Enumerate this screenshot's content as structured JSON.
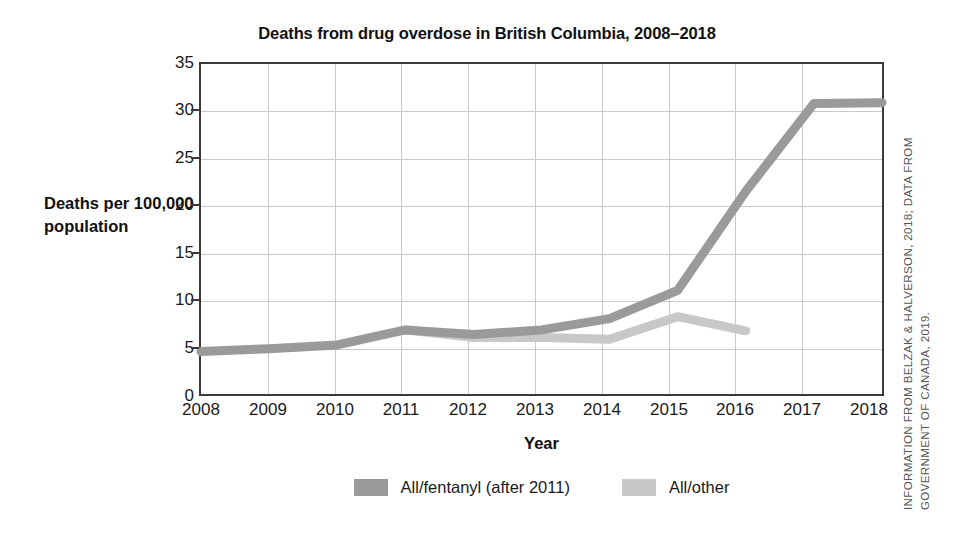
{
  "chart_data": {
    "type": "line",
    "title": "Deaths from drug overdose in British Columbia, 2008–2018",
    "xlabel": "Year",
    "ylabel": "Deaths per 100,000 population",
    "categories": [
      "2008",
      "2009",
      "2010",
      "2011",
      "2012",
      "2013",
      "2014",
      "2015",
      "2016",
      "2017",
      "2018"
    ],
    "x": [
      2008,
      2009,
      2010,
      2011,
      2012,
      2013,
      2014,
      2015,
      2016,
      2017,
      2018
    ],
    "xlim": [
      2008,
      2018
    ],
    "ylim": [
      0,
      35
    ],
    "yticks": [
      "0",
      "5",
      "10",
      "15",
      "20",
      "25",
      "30",
      "35"
    ],
    "ytick_values": [
      0,
      5,
      10,
      15,
      20,
      25,
      30,
      35
    ],
    "grid": true,
    "legend_position": "bottom",
    "series": [
      {
        "name": "All/fentanyl (after 2011)",
        "color": "#9a9a9a",
        "x": [
          2008,
          2009,
          2010,
          2011,
          2012,
          2013,
          2014,
          2015,
          2016,
          2017,
          2018
        ],
        "values": [
          4.5,
          4.8,
          5.2,
          6.8,
          6.3,
          6.8,
          8.0,
          11.0,
          21.5,
          30.8,
          30.9
        ]
      },
      {
        "name": "All/other",
        "color": "#c8c8c8",
        "x": [
          2011,
          2012,
          2013,
          2014,
          2015,
          2016
        ],
        "values": [
          6.8,
          6.0,
          6.0,
          5.8,
          8.2,
          6.7
        ]
      }
    ],
    "annotations": [
      "INFORMATION FROM BELZAK & HALVERSON, 2018;",
      "DATA FROM GOVERNMENT OF CANADA, 2019."
    ]
  },
  "credit": {
    "line1": "INFORMATION FROM BELZAK & HALVERSON, 2018;",
    "line2": "DATA FROM GOVERNMENT OF CANADA, 2019.",
    "full": "INFORMATION FROM BELZAK & HALVERSON, 2018; DATA FROM GOVERNMENT OF CANADA, 2019."
  },
  "colors": {
    "fentanyl": "#9a9a9a",
    "other": "#c8c8c8",
    "axis": "#3a3a3a",
    "grid": "#c9c9c9",
    "text": "#111111"
  }
}
